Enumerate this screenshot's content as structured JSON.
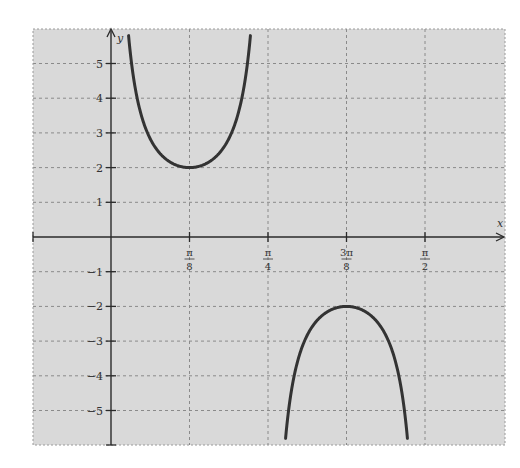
{
  "chart_data": {
    "type": "line",
    "title": "",
    "function": "y = 2 csc(4x)",
    "xlabel": "x",
    "ylabel": "y",
    "xlim_over_pi_8": [
      -1.0,
      5.02
    ],
    "ylim": [
      -6,
      6
    ],
    "grid": true,
    "grid_style": "dashed",
    "legend": null,
    "x_ticks": [
      {
        "value_over_pi_8": 1,
        "num": "π",
        "den": "8"
      },
      {
        "value_over_pi_8": 2,
        "num": "π",
        "den": "4"
      },
      {
        "value_over_pi_8": 3,
        "num": "3π",
        "den": "8"
      },
      {
        "value_over_pi_8": 4,
        "num": "π",
        "den": "2"
      }
    ],
    "y_ticks": [
      5,
      4,
      3,
      2,
      1,
      -1,
      -2,
      -3,
      -4,
      -5
    ],
    "y_tick_labels": [
      "5",
      "4",
      "3",
      "2",
      "1",
      "−1",
      "−2",
      "−3",
      "−4",
      "−5"
    ],
    "series": [
      {
        "name": "2csc(4x) branch 1",
        "x_range_over_pi_8": [
          0.2,
          1.8
        ],
        "key_points": [
          {
            "x": "π/8",
            "y": 2
          }
        ],
        "extremum": "local minimum (2) at x = π/8"
      },
      {
        "name": "2csc(4x) branch 2",
        "x_range_over_pi_8": [
          2.2,
          3.8
        ],
        "key_points": [
          {
            "x": "3π/8",
            "y": -2
          }
        ],
        "extremum": "local maximum (−2) at x = 3π/8"
      }
    ],
    "asymptotes_over_pi_8": [
      0,
      2,
      4
    ],
    "colors": {
      "background": "#d9d9d9",
      "grid": "#8a8a8a",
      "axis": "#2a2a2a",
      "curve": "#333333"
    }
  }
}
